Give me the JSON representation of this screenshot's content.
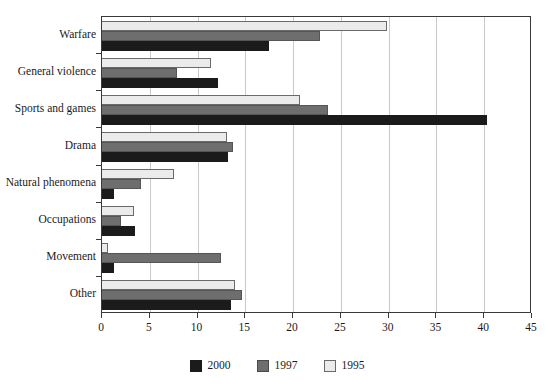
{
  "chart_data": {
    "type": "bar",
    "orientation": "horizontal",
    "title": "",
    "xlabel": "",
    "ylabel": "",
    "xlim": [
      0,
      45
    ],
    "xticks": [
      0,
      5,
      10,
      15,
      20,
      25,
      30,
      35,
      40,
      45
    ],
    "grid": true,
    "legend_position": "bottom-center",
    "categories": [
      "Warfare",
      "General violence",
      "Sports and games",
      "Drama",
      "Natural phenomena",
      "Occupations",
      "Movement",
      "Other"
    ],
    "series": [
      {
        "name": "2000",
        "color": "#1b1b1b",
        "values": [
          17.5,
          12.1,
          40.3,
          13.2,
          1.3,
          3.5,
          1.3,
          13.5
        ]
      },
      {
        "name": "1997",
        "color": "#6e6e6e",
        "values": [
          22.8,
          7.9,
          23.6,
          13.7,
          4.1,
          2.0,
          12.5,
          14.7
        ]
      },
      {
        "name": "1995",
        "color": "#ebebeb",
        "values": [
          29.8,
          11.4,
          20.7,
          13.1,
          7.5,
          3.4,
          0.6,
          13.9
        ]
      }
    ]
  },
  "legend": {
    "items": [
      {
        "label": "2000",
        "swatch": "legend-swatch-2000"
      },
      {
        "label": "1997",
        "swatch": "legend-swatch-1997"
      },
      {
        "label": "1995",
        "swatch": "legend-swatch-1995"
      }
    ]
  },
  "axis": {
    "x_tick_labels": [
      "0",
      "5",
      "10",
      "15",
      "20",
      "25",
      "30",
      "35",
      "40",
      "45"
    ]
  }
}
